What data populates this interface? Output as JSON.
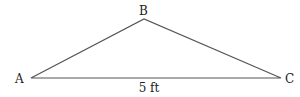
{
  "diagram": {
    "type": "triangle",
    "vertices": [
      {
        "label": "A",
        "x": 31,
        "y": 78
      },
      {
        "label": "B",
        "x": 144,
        "y": 19
      },
      {
        "label": "C",
        "x": 281,
        "y": 78
      }
    ],
    "side_label": "5 ft",
    "line_color": "#555555"
  }
}
